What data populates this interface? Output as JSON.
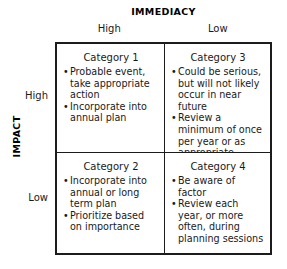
{
  "axes": {
    "column_axis_title": "IMMEDIACY",
    "row_axis_title": "IMPACT",
    "column_headers": [
      "High",
      "Low"
    ],
    "row_headers": [
      "High",
      "Low"
    ]
  },
  "quadrants": {
    "top_left": {
      "title": "Category 1",
      "bullets": [
        "Probable event, take appropriate action",
        "Incorporate into annual plan"
      ]
    },
    "top_right": {
      "title": "Category 3",
      "bullets": [
        "Could be serious, but will not likely occur in near future",
        "Review a minimum of once per year or as appropriate"
      ]
    },
    "bottom_left": {
      "title": "Category 2",
      "bullets": [
        "Incorporate into annual or long term plan",
        "Prioritize based on importance"
      ]
    },
    "bottom_right": {
      "title": "Category 4",
      "bullets": [
        "Be aware of factor",
        "Review each year, or more often, during planning sessions"
      ]
    }
  },
  "colors": {
    "border": "#1c1c1c",
    "text": "#1a1a1a",
    "background": "#ffffff"
  }
}
